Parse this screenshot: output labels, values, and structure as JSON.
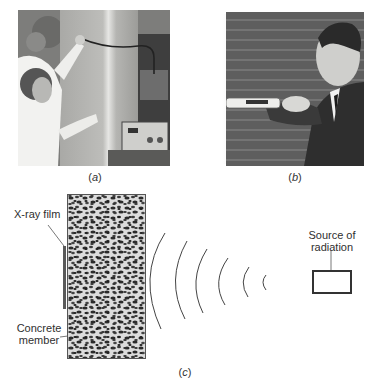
{
  "figure": {
    "panels": [
      {
        "id": "a",
        "caption_open": "(",
        "caption_letter": "a",
        "caption_close": ")",
        "description": "Person applying a probe to a concrete column, connected by cable to an instrument on a stand"
      },
      {
        "id": "b",
        "caption_open": "(",
        "caption_letter": "b",
        "caption_close": ")",
        "description": "Man in suit pressing a handheld testing device against a brick wall"
      },
      {
        "id": "c",
        "caption_open": "(",
        "caption_letter": "c",
        "caption_close": ")",
        "description": "Schematic of radiographic testing of a concrete member"
      }
    ],
    "diagram_c": {
      "labels": {
        "film": "X-ray film",
        "concrete_line1": "Concrete",
        "concrete_line2": "member",
        "source_line1": "Source of",
        "source_line2": "radiation"
      },
      "wave_count": 6
    }
  }
}
